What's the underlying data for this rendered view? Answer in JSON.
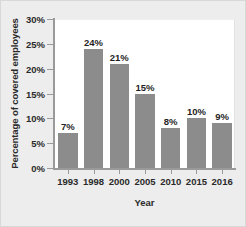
{
  "chart_data": {
    "type": "bar",
    "title": "",
    "xlabel": "Year",
    "ylabel": "Percentage of covered employees",
    "categories": [
      "1993",
      "1998",
      "2000",
      "2005",
      "2010",
      "2015",
      "2016"
    ],
    "values": [
      7,
      24,
      21,
      15,
      8,
      10,
      9
    ],
    "data_labels": [
      "7%",
      "24%",
      "21%",
      "15%",
      "8%",
      "10%",
      "9%"
    ],
    "ylim": [
      0,
      30
    ],
    "ytick_values": [
      0,
      5,
      10,
      15,
      20,
      25,
      30
    ],
    "ytick_labels": [
      "0%",
      "5%",
      "10%",
      "15%",
      "20%",
      "25%",
      "30%"
    ],
    "grid": false,
    "legend": null,
    "bar_color": "#8c8c8c",
    "plot_background": "#ffffff",
    "figure_background": "#ededed",
    "axis_color": "#9a9a9a",
    "text_color": "#2a2a2a"
  }
}
